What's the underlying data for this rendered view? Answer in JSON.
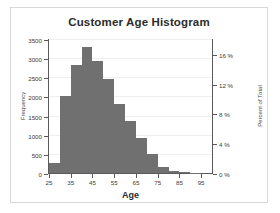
{
  "chart_data": {
    "type": "bar",
    "title": "Customer Age Histogram",
    "xlabel": "Age",
    "ylabel": "Frequency",
    "y2label": "Percent of Total",
    "grid": true,
    "legend": false,
    "xlim": [
      25,
      100
    ],
    "ylim": [
      0,
      3500
    ],
    "y2lim": [
      0,
      18
    ],
    "bin_width": 5,
    "bar_color": "#707070",
    "xticks": [
      25,
      35,
      45,
      55,
      65,
      75,
      85,
      95
    ],
    "xticklabels": [
      "25",
      "35",
      "45",
      "55",
      "65",
      "75",
      "85",
      "95"
    ],
    "yticks": [
      0,
      500,
      1000,
      1500,
      2000,
      2500,
      3000,
      3500
    ],
    "yticklabels": [
      "0",
      "500",
      "1000",
      "1500",
      "2000",
      "2500",
      "3000",
      "3500"
    ],
    "y2ticks": [
      0,
      4,
      8,
      12,
      16
    ],
    "y2ticklabels": [
      "0 %",
      "4 %",
      "8 %",
      "12 %",
      "16 %"
    ],
    "categories": [
      "25-30",
      "30-35",
      "35-40",
      "40-45",
      "45-50",
      "50-55",
      "55-60",
      "60-65",
      "65-70",
      "70-75",
      "75-80",
      "80-85",
      "85-90",
      "90-95"
    ],
    "bin_starts": [
      25,
      30,
      35,
      40,
      45,
      50,
      55,
      60,
      65,
      70,
      75,
      80,
      85,
      90
    ],
    "values": [
      250,
      2020,
      2820,
      3280,
      2930,
      2450,
      1810,
      1350,
      920,
      500,
      150,
      40,
      15,
      5
    ],
    "percent_values": [
      1.3,
      10.4,
      14.5,
      16.9,
      15.1,
      12.6,
      9.3,
      6.9,
      4.7,
      2.6,
      0.8,
      0.2,
      0.1,
      0.0
    ]
  }
}
